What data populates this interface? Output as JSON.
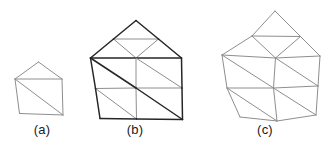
{
  "figure": {
    "width": 334,
    "height": 150,
    "background_color": "#ffffff",
    "captions": [
      {
        "id": "a",
        "label": "(a)"
      },
      {
        "id": "b",
        "label": "(b)"
      },
      {
        "id": "c",
        "label": "(c)"
      }
    ]
  },
  "style": {
    "dark_stroke": "#262626",
    "light_stroke": "#8e8e8e",
    "medium_stroke": "#4a4a4a",
    "dark_width": 1.5,
    "light_width": 1.0,
    "caption_color": "#1a1a1a"
  },
  "chart_data": {
    "type": "diagram",
    "title": "",
    "panels": [
      {
        "id": "a",
        "label": "(a)",
        "vertex_count": 5,
        "triangle_count": 3,
        "vertices": {
          "apex": [
            38.5,
            62.0
          ],
          "upper_left": [
            15.0,
            79.0
          ],
          "upper_right": [
            62.0,
            79.0
          ],
          "lower_left": [
            19.5,
            113.5
          ],
          "lower_right": [
            63.0,
            115.0
          ]
        },
        "boundary_edges": [
          [
            "upper_left",
            "apex"
          ],
          [
            "apex",
            "upper_right"
          ],
          [
            "upper_right",
            "lower_right"
          ],
          [
            "lower_right",
            "lower_left"
          ],
          [
            "lower_left",
            "upper_left"
          ]
        ],
        "interior_edges": [
          [
            "upper_left",
            "upper_right"
          ],
          [
            "upper_left",
            "lower_right"
          ]
        ]
      },
      {
        "id": "b",
        "label": "(b)",
        "vertex_count": 13,
        "triangle_count": 12,
        "vertices": {
          "apex": [
            136.0,
            20.5
          ],
          "roof_left_mid": [
            113.5,
            39.0
          ],
          "roof_right_mid": [
            158.5,
            39.0
          ],
          "roof_center": [
            136.0,
            39.0
          ],
          "upper_left": [
            90.5,
            58.0
          ],
          "upper_mid": [
            136.0,
            58.0
          ],
          "upper_right": [
            181.5,
            58.0
          ],
          "mid_left": [
            95.5,
            88.5
          ],
          "mid_center": [
            136.0,
            88.0
          ],
          "mid_right": [
            182.0,
            88.0
          ],
          "lower_left": [
            100.0,
            118.5
          ],
          "lower_mid": [
            136.5,
            119.0
          ],
          "lower_right": [
            182.5,
            119.5
          ]
        },
        "boundary_edges": [
          [
            "upper_left",
            "roof_left_mid"
          ],
          [
            "roof_left_mid",
            "apex"
          ],
          [
            "apex",
            "roof_right_mid"
          ],
          [
            "roof_right_mid",
            "upper_right"
          ],
          [
            "upper_right",
            "mid_right"
          ],
          [
            "mid_right",
            "lower_right"
          ],
          [
            "lower_right",
            "lower_mid"
          ],
          [
            "lower_mid",
            "lower_left"
          ],
          [
            "lower_left",
            "mid_left"
          ],
          [
            "mid_left",
            "upper_left"
          ]
        ],
        "interior_edges": [
          [
            "roof_left_mid",
            "roof_right_mid"
          ],
          [
            "roof_left_mid",
            "upper_mid"
          ],
          [
            "roof_right_mid",
            "upper_mid"
          ],
          [
            "upper_left",
            "upper_mid"
          ],
          [
            "upper_mid",
            "upper_right"
          ],
          [
            "mid_left",
            "mid_center"
          ],
          [
            "mid_center",
            "mid_right"
          ],
          [
            "upper_mid",
            "mid_center"
          ],
          [
            "mid_center",
            "lower_mid"
          ],
          [
            "upper_left",
            "mid_center"
          ],
          [
            "mid_center",
            "lower_right"
          ],
          [
            "upper_mid",
            "mid_right"
          ],
          [
            "mid_left",
            "lower_mid"
          ]
        ],
        "emphasized_edges": [
          [
            "upper_left",
            "upper_mid"
          ],
          [
            "upper_mid",
            "upper_right"
          ],
          [
            "upper_left",
            "mid_center"
          ],
          [
            "mid_center",
            "lower_right"
          ],
          [
            "upper_left",
            "roof_left_mid"
          ],
          [
            "roof_left_mid",
            "apex"
          ],
          [
            "apex",
            "roof_right_mid"
          ],
          [
            "roof_right_mid",
            "upper_right"
          ],
          [
            "upper_left",
            "mid_left"
          ],
          [
            "mid_left",
            "lower_left"
          ],
          [
            "lower_left",
            "lower_mid"
          ],
          [
            "lower_mid",
            "lower_right"
          ],
          [
            "lower_right",
            "mid_right"
          ],
          [
            "mid_right",
            "upper_right"
          ]
        ]
      },
      {
        "id": "c",
        "label": "(c)",
        "vertex_count": 13,
        "triangle_count": 12,
        "smoothed": true,
        "vertices": {
          "apex": [
            275.0,
            11.0
          ],
          "roof_left_mid": [
            252.0,
            36.0
          ],
          "roof_right_mid": [
            300.5,
            36.5
          ],
          "upper_left": [
            222.0,
            55.0
          ],
          "upper_mid": [
            275.5,
            58.0
          ],
          "upper_right": [
            320.0,
            56.0
          ],
          "mid_left": [
            227.0,
            88.0
          ],
          "mid_center": [
            273.5,
            88.0
          ],
          "mid_right": [
            318.0,
            86.0
          ],
          "lower_left": [
            240.0,
            117.0
          ],
          "lower_mid": [
            277.0,
            121.0
          ],
          "lower_right": [
            316.0,
            115.0
          ]
        },
        "boundary_edges": [
          [
            "upper_left",
            "roof_left_mid"
          ],
          [
            "roof_left_mid",
            "apex"
          ],
          [
            "apex",
            "roof_right_mid"
          ],
          [
            "roof_right_mid",
            "upper_right"
          ],
          [
            "upper_right",
            "mid_right"
          ],
          [
            "mid_right",
            "lower_right"
          ],
          [
            "lower_right",
            "lower_mid"
          ],
          [
            "lower_mid",
            "lower_left"
          ],
          [
            "lower_left",
            "mid_left"
          ],
          [
            "mid_left",
            "upper_left"
          ]
        ],
        "interior_edges": [
          [
            "roof_left_mid",
            "roof_right_mid"
          ],
          [
            "roof_left_mid",
            "upper_mid"
          ],
          [
            "roof_right_mid",
            "upper_mid"
          ],
          [
            "upper_left",
            "upper_mid"
          ],
          [
            "upper_mid",
            "upper_right"
          ],
          [
            "mid_left",
            "mid_center"
          ],
          [
            "mid_center",
            "mid_right"
          ],
          [
            "upper_mid",
            "mid_center"
          ],
          [
            "mid_center",
            "lower_mid"
          ],
          [
            "upper_left",
            "mid_center"
          ],
          [
            "mid_center",
            "lower_right"
          ],
          [
            "upper_mid",
            "mid_right"
          ],
          [
            "mid_left",
            "lower_mid"
          ]
        ],
        "emphasized_edges": []
      }
    ]
  }
}
